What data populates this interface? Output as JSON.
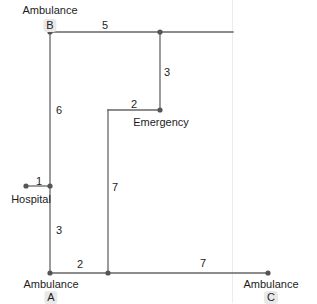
{
  "diagram": {
    "style": {
      "edge_color": "#666666",
      "node_color": "#555555",
      "text_color": "#1c1c1c",
      "tag_background": "#e9e9e9",
      "page_divider_color": "#ececec",
      "background": "#ffffff"
    },
    "nodes": [
      {
        "id": "B",
        "label": "Ambulance",
        "tag": "B",
        "x": 50,
        "y": 32,
        "dot": true
      },
      {
        "id": "corner_tr",
        "label": "",
        "tag": "",
        "x": 160,
        "y": 32,
        "dot": true
      },
      {
        "id": "emergency",
        "label": "Emergency",
        "tag": "",
        "x": 160,
        "y": 110,
        "dot": true
      },
      {
        "id": "corner_e",
        "label": "",
        "tag": "",
        "x": 108,
        "y": 110,
        "dot": false
      },
      {
        "id": "hospital",
        "label": "Hospital",
        "tag": "",
        "x": 26,
        "y": 186,
        "dot": true
      },
      {
        "id": "junc_h",
        "label": "",
        "tag": "",
        "x": 50,
        "y": 186,
        "dot": true
      },
      {
        "id": "A",
        "label": "Ambulance",
        "tag": "A",
        "x": 50,
        "y": 273,
        "dot": true
      },
      {
        "id": "junc_b",
        "label": "",
        "tag": "",
        "x": 108,
        "y": 273,
        "dot": true
      },
      {
        "id": "C",
        "label": "Ambulance",
        "tag": "C",
        "x": 268,
        "y": 273,
        "dot": true
      }
    ],
    "edges": [
      {
        "from": "B",
        "to": "corner_tr",
        "weight": "5",
        "label_x": 105,
        "label_y": 20
      },
      {
        "from": "corner_tr",
        "to": "tail_right",
        "weight": "",
        "label_x": 0,
        "label_y": 0
      },
      {
        "from": "corner_tr",
        "to": "emergency",
        "weight": "3",
        "label_x": 167,
        "label_y": 71
      },
      {
        "from": "emergency",
        "to": "corner_e",
        "weight": "2",
        "label_x": 134,
        "label_y": 101
      },
      {
        "from": "corner_e",
        "to": "junc_b",
        "weight": "7",
        "label_x": 115,
        "label_y": 189
      },
      {
        "from": "B",
        "to": "junc_h",
        "weight": "6",
        "label_x": 58,
        "label_y": 109
      },
      {
        "from": "hospital",
        "to": "junc_h",
        "weight": "1",
        "label_x": 38,
        "label_y": 177
      },
      {
        "from": "junc_h",
        "to": "A",
        "weight": "3",
        "label_x": 58,
        "label_y": 228
      },
      {
        "from": "A",
        "to": "junc_b",
        "weight": "2",
        "label_x": 79,
        "label_y": 261
      },
      {
        "from": "junc_b",
        "to": "C",
        "weight": "7",
        "label_x": 202,
        "label_y": 260
      }
    ],
    "weights": {
      "b_to_corner_tr": "5",
      "corner_tr_to_emergency": "3",
      "emergency_to_corner_e": "2",
      "corner_e_to_junction": "7",
      "b_to_hospital_junction": "6",
      "hospital_to_junction": "1",
      "junction_to_a": "3",
      "a_to_junction_b": "2",
      "junction_b_to_c": "7"
    },
    "labels": {
      "ambulance": "Ambulance",
      "hospital": "Hospital",
      "emergency": "Emergency",
      "tag_a": "A",
      "tag_b": "B",
      "tag_c": "C"
    }
  }
}
